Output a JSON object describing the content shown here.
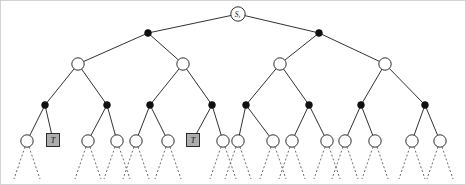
{
  "figure": {
    "type": "tree-diagram",
    "width": 466,
    "height": 185,
    "background_color": "#ffffff",
    "frame": {
      "visible": true,
      "color": "#c9c9c9"
    }
  },
  "style": {
    "edge_color": "#1a1a1a",
    "dashed_edge_color": "#5a5a5a",
    "open_node_fill": "#ffffff",
    "filled_node_fill": "#111111",
    "box_fill": "#adadad",
    "label_color": "#111111",
    "open_node_radius": 6.2,
    "filled_node_radius": 3.4,
    "root_node_radius": 7.2,
    "box_size": 13
  },
  "levels": [
    {
      "index": 0,
      "name": "root",
      "y": 14,
      "node_kind": "labeled-circle"
    },
    {
      "index": 1,
      "name": "level-1",
      "y": 33,
      "node_kind": "filled-dot"
    },
    {
      "index": 2,
      "name": "level-2",
      "y": 64,
      "node_kind": "open-circle"
    },
    {
      "index": 3,
      "name": "level-3",
      "y": 105,
      "node_kind": "filled-dot"
    },
    {
      "index": 4,
      "name": "leaf-level",
      "y": 141,
      "node_kind": "open-circle-or-box"
    }
  ],
  "nodes": {
    "root": [
      {
        "id": "r0",
        "x": 238,
        "y": 14,
        "kind": "labeled-circle",
        "label": "S",
        "sublabel": "t"
      }
    ],
    "level1": [
      {
        "id": "a0",
        "x": 148,
        "y": 33,
        "kind": "filled-dot"
      },
      {
        "id": "a1",
        "x": 319,
        "y": 33,
        "kind": "filled-dot"
      }
    ],
    "level2": [
      {
        "id": "b0",
        "x": 78,
        "y": 64,
        "kind": "open-circle"
      },
      {
        "id": "b1",
        "x": 183,
        "y": 64,
        "kind": "open-circle"
      },
      {
        "id": "b2",
        "x": 280,
        "y": 64,
        "kind": "open-circle"
      },
      {
        "id": "b3",
        "x": 385,
        "y": 64,
        "kind": "open-circle"
      }
    ],
    "level3": [
      {
        "id": "c0",
        "x": 45,
        "y": 105,
        "kind": "filled-dot"
      },
      {
        "id": "c1",
        "x": 107,
        "y": 105,
        "kind": "filled-dot"
      },
      {
        "id": "c2",
        "x": 150,
        "y": 105,
        "kind": "filled-dot"
      },
      {
        "id": "c3",
        "x": 212,
        "y": 105,
        "kind": "filled-dot"
      },
      {
        "id": "c4",
        "x": 246,
        "y": 105,
        "kind": "filled-dot"
      },
      {
        "id": "c5",
        "x": 309,
        "y": 105,
        "kind": "filled-dot"
      },
      {
        "id": "c6",
        "x": 361,
        "y": 105,
        "kind": "filled-dot"
      },
      {
        "id": "c7",
        "x": 425,
        "y": 105,
        "kind": "filled-dot"
      }
    ],
    "leaves": [
      {
        "id": "d0",
        "x": 27,
        "y": 141,
        "kind": "open-circle",
        "label": ""
      },
      {
        "id": "d1",
        "x": 53,
        "y": 140,
        "kind": "box",
        "label": "T"
      },
      {
        "id": "d2",
        "x": 88,
        "y": 141,
        "kind": "open-circle",
        "label": ""
      },
      {
        "id": "d3",
        "x": 117,
        "y": 141,
        "kind": "open-circle",
        "label": ""
      },
      {
        "id": "d4",
        "x": 136,
        "y": 141,
        "kind": "open-circle",
        "label": ""
      },
      {
        "id": "d5",
        "x": 168,
        "y": 141,
        "kind": "open-circle",
        "label": ""
      },
      {
        "id": "d6",
        "x": 193,
        "y": 140,
        "kind": "box",
        "label": "T"
      },
      {
        "id": "d7",
        "x": 223,
        "y": 141,
        "kind": "open-circle",
        "label": ""
      },
      {
        "id": "d8",
        "x": 238,
        "y": 141,
        "kind": "open-circle",
        "label": ""
      },
      {
        "id": "d9",
        "x": 273,
        "y": 141,
        "kind": "open-circle",
        "label": ""
      },
      {
        "id": "d10",
        "x": 292,
        "y": 141,
        "kind": "open-circle",
        "label": ""
      },
      {
        "id": "d11",
        "x": 327,
        "y": 141,
        "kind": "open-circle",
        "label": ""
      },
      {
        "id": "d12",
        "x": 345,
        "y": 141,
        "kind": "open-circle",
        "label": ""
      },
      {
        "id": "d13",
        "x": 375,
        "y": 141,
        "kind": "open-circle",
        "label": ""
      },
      {
        "id": "d14",
        "x": 412,
        "y": 141,
        "kind": "open-circle",
        "label": ""
      },
      {
        "id": "d15",
        "x": 440,
        "y": 141,
        "kind": "open-circle",
        "label": ""
      }
    ]
  },
  "edges": [
    {
      "from": "r0",
      "to": "a0",
      "style": "solid"
    },
    {
      "from": "r0",
      "to": "a1",
      "style": "solid"
    },
    {
      "from": "a0",
      "to": "b0",
      "style": "solid"
    },
    {
      "from": "a0",
      "to": "b1",
      "style": "solid"
    },
    {
      "from": "a1",
      "to": "b2",
      "style": "solid"
    },
    {
      "from": "a1",
      "to": "b3",
      "style": "solid"
    },
    {
      "from": "b0",
      "to": "c0",
      "style": "solid"
    },
    {
      "from": "b0",
      "to": "c1",
      "style": "solid"
    },
    {
      "from": "b1",
      "to": "c2",
      "style": "solid"
    },
    {
      "from": "b1",
      "to": "c3",
      "style": "solid"
    },
    {
      "from": "b2",
      "to": "c4",
      "style": "solid"
    },
    {
      "from": "b2",
      "to": "c5",
      "style": "solid"
    },
    {
      "from": "b3",
      "to": "c6",
      "style": "solid"
    },
    {
      "from": "b3",
      "to": "c7",
      "style": "solid"
    },
    {
      "from": "c0",
      "to": "d0",
      "style": "solid"
    },
    {
      "from": "c0",
      "to": "d1",
      "style": "solid"
    },
    {
      "from": "c1",
      "to": "d2",
      "style": "solid"
    },
    {
      "from": "c1",
      "to": "d3",
      "style": "solid"
    },
    {
      "from": "c2",
      "to": "d4",
      "style": "solid"
    },
    {
      "from": "c2",
      "to": "d5",
      "style": "solid"
    },
    {
      "from": "c3",
      "to": "d6",
      "style": "solid"
    },
    {
      "from": "c3",
      "to": "d7",
      "style": "solid"
    },
    {
      "from": "c4",
      "to": "d8",
      "style": "solid"
    },
    {
      "from": "c4",
      "to": "d9",
      "style": "solid"
    },
    {
      "from": "c5",
      "to": "d10",
      "style": "solid"
    },
    {
      "from": "c5",
      "to": "d11",
      "style": "solid"
    },
    {
      "from": "c6",
      "to": "d12",
      "style": "solid"
    },
    {
      "from": "c6",
      "to": "d13",
      "style": "solid"
    },
    {
      "from": "c7",
      "to": "d14",
      "style": "solid"
    },
    {
      "from": "c7",
      "to": "d15",
      "style": "solid"
    }
  ],
  "leaf_descenders": {
    "style": "dashed",
    "count_per_leaf": 2,
    "dx": 13,
    "dy": 38,
    "skip_leaf_ids": [
      "d1",
      "d6"
    ]
  },
  "legend": {
    "filled_dot_meaning": "expanded internal node",
    "open_circle_meaning": "unexpanded node",
    "box_meaning": "terminal state T"
  }
}
